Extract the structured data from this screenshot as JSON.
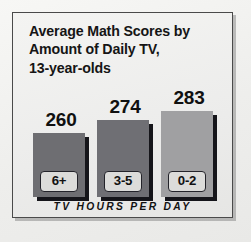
{
  "chart_data": {
    "type": "bar",
    "title": "Average Math Scores by Amount of Daily TV, 13-year-olds",
    "title_lines": [
      "Average Math Scores by",
      "Amount of Daily TV,",
      "13-year-olds"
    ],
    "categories": [
      "6+",
      "3-5",
      "0-2"
    ],
    "values": [
      260,
      274,
      283
    ],
    "xlabel": "TV HOURS PER DAY",
    "ylabel": "",
    "ylim": [
      250,
      290
    ],
    "grid": false,
    "legend": false,
    "series": [
      {
        "name": "Average math score",
        "values": [
          260,
          274,
          283
        ]
      }
    ],
    "bars": [
      {
        "category": "6+",
        "value": 260,
        "color": "#6e6e72"
      },
      {
        "category": "3-5",
        "value": 274,
        "color": "#6f6f74"
      },
      {
        "category": "0-2",
        "value": 283,
        "color": "#a0a0a2"
      }
    ]
  },
  "colors": {
    "bar_dark": "#6e6e72",
    "bar_light": "#a0a0a2",
    "shadow": "#15151a",
    "frame_border": "#4a4a4a",
    "panel_background": "#ececeb",
    "text": "#121212",
    "chip_fill": "#dcdcda"
  }
}
